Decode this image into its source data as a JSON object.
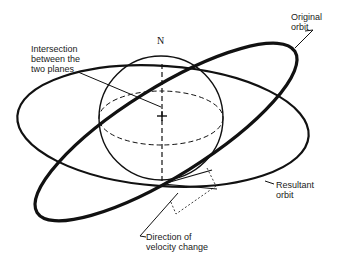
{
  "diagram": {
    "north_label": "N",
    "labels": {
      "intersection": "Intersection\nbetween the\ntwo planes",
      "original_orbit": "Original\norbit",
      "resultant_orbit": "Resultant\norbit",
      "velocity_change": "Direction of\nvelocity change"
    },
    "elements": [
      "sphere",
      "equator (dashed)",
      "polar axis (dashed)",
      "center mark",
      "original orbit (tilted ellipse)",
      "resultant orbit (ellipse)",
      "velocity vector parallelogram (dotted)"
    ],
    "colors": {
      "stroke": "#111111",
      "background": "#ffffff"
    }
  }
}
